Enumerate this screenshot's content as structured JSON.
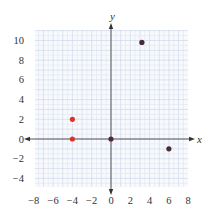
{
  "chart_data": {
    "type": "scatter",
    "title": "",
    "xlabel": "x",
    "ylabel": "y",
    "xlim": [
      -8,
      8
    ],
    "ylim": [
      -5,
      11
    ],
    "grid": true,
    "minor_grid_step": 1,
    "x_ticks": [
      -8,
      -6,
      -4,
      -2,
      0,
      2,
      4,
      6,
      8
    ],
    "y_ticks": [
      10,
      8,
      6,
      4,
      2,
      0,
      -2,
      -4
    ],
    "x_tick_labels": [
      "−8",
      "−6",
      "−4",
      "−2",
      "0",
      "2",
      "4",
      "6",
      "8"
    ],
    "y_tick_labels": [
      "10",
      "8",
      "6",
      "4",
      "2",
      "0",
      "−2",
      "−4"
    ],
    "series": [
      {
        "name": "red points",
        "color": "#d9352b",
        "points": [
          [
            -4,
            2
          ],
          [
            -4,
            0
          ]
        ]
      },
      {
        "name": "dark points",
        "color": "#4a2a3a",
        "points": [
          [
            0,
            0
          ],
          [
            3.2,
            9.8
          ],
          [
            6,
            -1
          ]
        ]
      }
    ]
  },
  "colors": {
    "grid_minor": "#dfe6f2",
    "grid_major": "#c9d3e6",
    "axis": "#555555"
  }
}
